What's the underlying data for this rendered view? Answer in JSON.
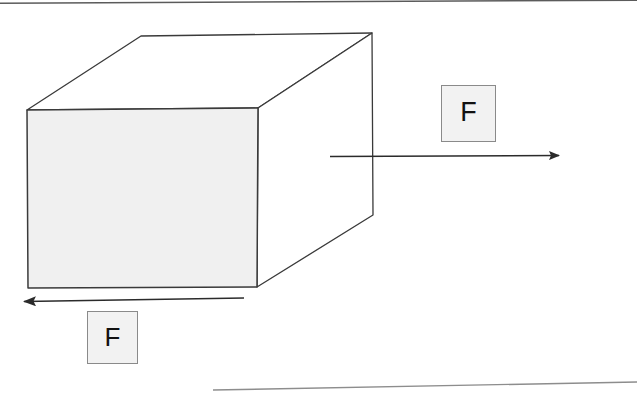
{
  "figure": {
    "background_color": "#ffffff",
    "width": 637,
    "height": 393
  },
  "labels": {
    "applied_force": "F",
    "friction_force": "F"
  },
  "colors": {
    "outline": "#3a3a3a",
    "face_fill": "#f0f0f0",
    "box_fill": "#f2f2f2",
    "box_border": "#8a8a8a",
    "arrow": "#2b2b2b",
    "frame_line": "#555555",
    "text": "#111111"
  },
  "geometry": {
    "cube": {
      "front_face": [
        [
          27,
          110
        ],
        [
          258,
          108
        ],
        [
          257,
          287
        ],
        [
          28,
          288
        ]
      ],
      "top_face": [
        [
          27,
          110
        ],
        [
          141,
          36
        ],
        [
          372,
          33
        ],
        [
          258,
          108
        ]
      ],
      "right_face": [
        [
          258,
          108
        ],
        [
          372,
          33
        ],
        [
          373,
          215
        ],
        [
          257,
          287
        ]
      ]
    },
    "arrow_right": {
      "from": [
        330,
        156
      ],
      "to": [
        566,
        155
      ],
      "direction": "right"
    },
    "arrow_left": {
      "from": [
        244,
        298
      ],
      "to": [
        13,
        302
      ],
      "direction": "left"
    },
    "frame_top_line": {
      "from": [
        0,
        3
      ],
      "to": [
        637,
        0
      ]
    },
    "frame_bottom_line": {
      "from": [
        213,
        390
      ],
      "to": [
        637,
        382
      ]
    }
  },
  "annotations": {
    "applied_force_description": "Rightward applied force F acting on the block",
    "friction_force_description": "Leftward friction force F acting at the base of the block"
  }
}
